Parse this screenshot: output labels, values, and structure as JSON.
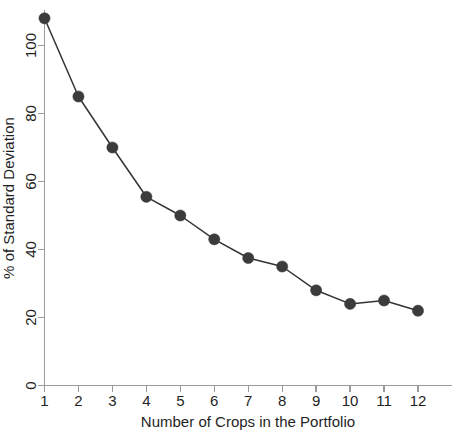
{
  "chart_data": {
    "type": "line",
    "title": "",
    "xlabel": "Number of Crops in the Portfolio",
    "ylabel": "% of Standard Deviation",
    "x": [
      1,
      2,
      3,
      4,
      5,
      6,
      7,
      8,
      9,
      10,
      11,
      12
    ],
    "values": [
      108,
      85,
      70,
      55.5,
      50,
      43,
      37.5,
      35,
      28,
      24,
      25,
      22
    ],
    "categories": [
      "1",
      "2",
      "3",
      "4",
      "5",
      "6",
      "7",
      "8",
      "9",
      "10",
      "11",
      "12"
    ],
    "xticklabels": [
      "1",
      "2",
      "3",
      "4",
      "5",
      "6",
      "7",
      "8",
      "9",
      "10",
      "11",
      "12"
    ],
    "yticklabels": [
      "0",
      "20",
      "40",
      "60",
      "80",
      "100"
    ],
    "yticks": [
      0,
      20,
      40,
      60,
      80,
      100
    ],
    "xlim": [
      1,
      12
    ],
    "ylim": [
      0,
      112
    ],
    "grid": false,
    "legend": null,
    "marker": "filled-circle",
    "marker_color": "#3b3b3b",
    "line_color": "#333333",
    "axis_color": "#9a9a9a",
    "background": "#ffffff"
  }
}
